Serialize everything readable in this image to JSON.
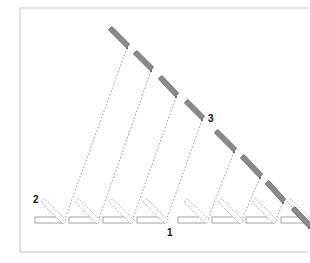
{
  "diagram": {
    "labels": [
      {
        "text": "1",
        "x": 167,
        "y": 236
      },
      {
        "text": "2",
        "x": 33,
        "y": 203
      },
      {
        "text": "3",
        "x": 208,
        "y": 122
      }
    ],
    "frame": {
      "left": 20,
      "top": 8,
      "right": 308,
      "bottom": 252,
      "color": "#d9d9d9"
    },
    "bar_color": "#8a8a8a",
    "bars": [
      {
        "x1": 110,
        "y1": 28,
        "x2": 128,
        "y2": 46
      },
      {
        "x1": 135,
        "y1": 52,
        "x2": 152,
        "y2": 69
      },
      {
        "x1": 160,
        "y1": 77,
        "x2": 177,
        "y2": 95
      },
      {
        "x1": 186,
        "y1": 101,
        "x2": 203,
        "y2": 118
      },
      {
        "x1": 216,
        "y1": 131,
        "x2": 235,
        "y2": 150
      },
      {
        "x1": 242,
        "y1": 156,
        "x2": 261,
        "y2": 176
      },
      {
        "x1": 267,
        "y1": 182,
        "x2": 284,
        "y2": 201
      },
      {
        "x1": 293,
        "y1": 208,
        "x2": 310,
        "y2": 226
      }
    ],
    "units": [
      {
        "x": 35
      },
      {
        "x": 69
      },
      {
        "x": 103
      },
      {
        "x": 137
      },
      {
        "x": 178
      },
      {
        "x": 212
      },
      {
        "x": 246
      },
      {
        "x": 281
      }
    ],
    "unit_geometry": {
      "base_width": 27,
      "base_height": 6,
      "base_y": 217,
      "tilt_length": 31,
      "tilt_width": 5
    }
  }
}
